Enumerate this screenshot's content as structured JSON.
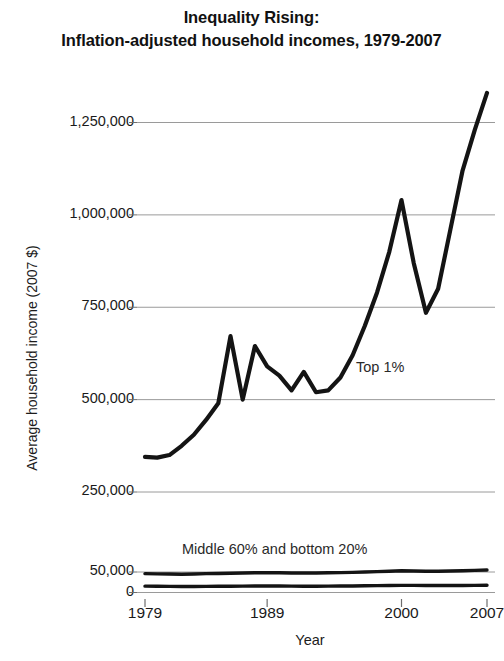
{
  "chart_data": {
    "type": "line",
    "title": "Inequality Rising:\nInflation-adjusted household incomes, 1979-2007",
    "title_line1": "Inequality Rising:",
    "title_line2": "Inflation-adjusted household incomes, 1979-2007",
    "xlabel": "Year",
    "ylabel": "Average household income (2007 $)",
    "grid": true,
    "legend_position": "inline-annotations",
    "xlim": [
      1979,
      2007
    ],
    "ylim": [
      0,
      1400000
    ],
    "xticks": [
      1979,
      1989,
      2000,
      2007
    ],
    "xtick_labels": [
      "1979",
      "1989",
      "2000",
      "2007"
    ],
    "yticks": [
      0,
      50000,
      250000,
      500000,
      750000,
      1000000,
      1250000
    ],
    "ytick_labels": [
      "0",
      "50,000",
      "250,000",
      "500,000",
      "750,000",
      "1,000,000",
      "1,250,000"
    ],
    "y_axis_note": "Broken / compressed axis below 250,000",
    "annotations": [
      {
        "text": "Top 1%",
        "x": 2002,
        "y": 600000
      },
      {
        "text": "Middle 60% and bottom 20%",
        "x": 1989,
        "y": 95000
      }
    ],
    "x": [
      1979,
      1980,
      1981,
      1982,
      1983,
      1984,
      1985,
      1986,
      1987,
      1988,
      1989,
      1990,
      1991,
      1992,
      1993,
      1994,
      1995,
      1996,
      1997,
      1998,
      1999,
      2000,
      2001,
      2002,
      2003,
      2004,
      2005,
      2006,
      2007
    ],
    "series": [
      {
        "name": "Top 1%",
        "color": "#141414",
        "values": [
          345000,
          343000,
          350000,
          375000,
          405000,
          445000,
          490000,
          672000,
          500000,
          645000,
          590000,
          565000,
          525000,
          575000,
          520000,
          525000,
          560000,
          620000,
          700000,
          790000,
          900000,
          1040000,
          870000,
          735000,
          800000,
          960000,
          1120000,
          1230000,
          1330000
        ]
      },
      {
        "name": "Middle 60%",
        "color": "#141414",
        "values": [
          46000,
          45500,
          45000,
          44500,
          45000,
          46000,
          46500,
          47000,
          47500,
          48000,
          48500,
          48000,
          47500,
          47500,
          47500,
          48000,
          48500,
          49000,
          50000,
          51000,
          52000,
          53000,
          52500,
          52000,
          52000,
          52500,
          53000,
          54000,
          55000
        ]
      },
      {
        "name": "Bottom 20%",
        "color": "#141414",
        "values": [
          15500,
          15200,
          14900,
          14600,
          14700,
          15000,
          15200,
          15400,
          15600,
          15800,
          16000,
          15800,
          15500,
          15400,
          15300,
          15500,
          15800,
          16000,
          16400,
          16800,
          17200,
          17500,
          17300,
          17000,
          17000,
          17100,
          17200,
          17400,
          17600
        ]
      }
    ]
  }
}
